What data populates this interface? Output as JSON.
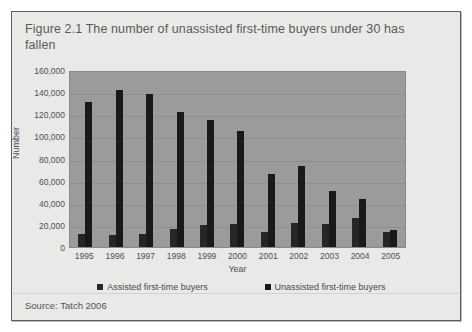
{
  "figure": {
    "title": "Figure 2.1 The number of unassisted first-time buyers under 30 has fallen",
    "source": "Source: Tatch 2006"
  },
  "colors": {
    "card_background": "#e9e9e7",
    "plot_background": "#9b9b9b",
    "card_border": "#5d5d5d",
    "bar_assisted": "#282525",
    "bar_unassisted": "#1a1818",
    "text": "#4f4f4f"
  },
  "chart_data": {
    "type": "bar",
    "title": "Figure 2.1 The number of unassisted first-time buyers under 30 has fallen",
    "xlabel": "Year",
    "ylabel": "Number",
    "categories": [
      "1995",
      "1996",
      "1997",
      "1998",
      "1999",
      "2000",
      "2001",
      "2002",
      "2003",
      "2004",
      "2005"
    ],
    "series": [
      {
        "name": "Assisted first-time buyers",
        "values": [
          11500,
          11000,
          11500,
          16000,
          20000,
          20500,
          14000,
          22000,
          20500,
          26000,
          14000
        ]
      },
      {
        "name": "Unassisted first-time buyers",
        "values": [
          131000,
          142000,
          138000,
          122000,
          115000,
          105000,
          66000,
          73000,
          51000,
          43000,
          15000
        ]
      }
    ],
    "ylim": [
      0,
      160000
    ],
    "ytick_labels": [
      "160,000",
      "140,000",
      "120,000",
      "100,000",
      "80,000",
      "60,000",
      "40,000",
      "20,000",
      "0"
    ],
    "ytick_values": [
      160000,
      140000,
      120000,
      100000,
      80000,
      60000,
      40000,
      20000,
      0
    ],
    "grid": true,
    "legend_position": "bottom"
  }
}
